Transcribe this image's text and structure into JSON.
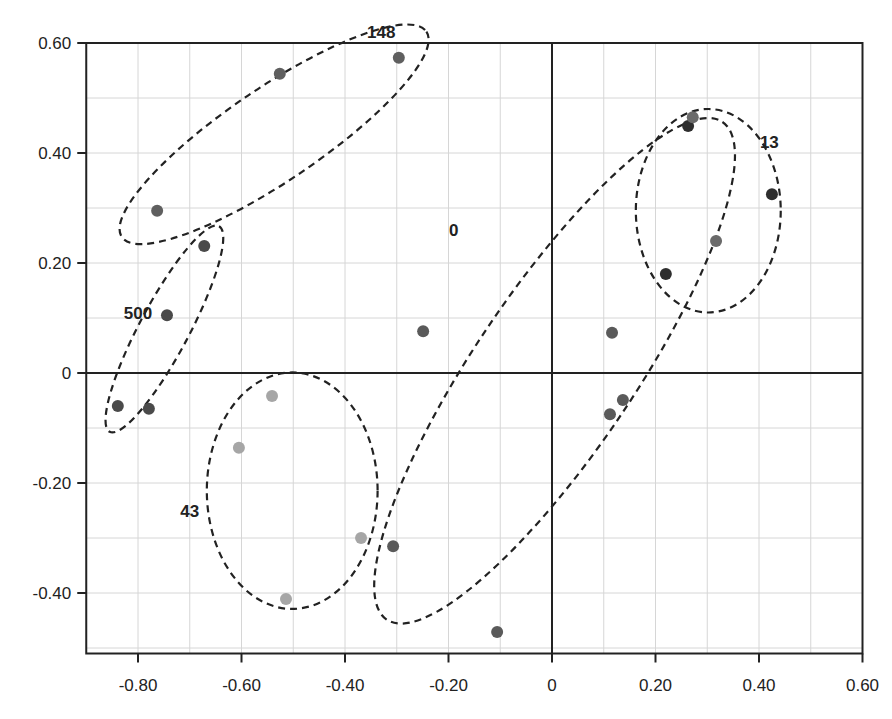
{
  "chart_data": {
    "type": "scatter",
    "title": "",
    "xlabel": "",
    "ylabel": "",
    "xlim": [
      -0.9,
      0.6
    ],
    "ylim": [
      -0.51,
      0.6
    ],
    "grid": true,
    "grid_step": 0.1,
    "x_ticks": [
      -0.8,
      -0.6,
      -0.4,
      -0.2,
      0,
      0.2,
      0.4,
      0.6
    ],
    "x_tick_labels": [
      "-0.80",
      "-0.60",
      "-0.40",
      "-0.20",
      "0",
      "0.20",
      "0.40",
      "0.60"
    ],
    "y_ticks": [
      0.6,
      0.4,
      0.2,
      0,
      -0.2,
      -0.4
    ],
    "y_tick_labels": [
      "0.60",
      "0.40",
      "0.20",
      "0",
      "-0.20",
      "-0.40"
    ],
    "legend": null,
    "clusters": [
      {
        "label": "148",
        "label_pos": [
          -0.33,
          0.62
        ],
        "ellipse": {
          "cx": -0.537,
          "cy": 0.434,
          "rx": 0.355,
          "ry": 0.085,
          "rotation_deg": -34
        }
      },
      {
        "label": "500",
        "label_pos": [
          -0.8,
          0.11
        ],
        "ellipse": {
          "cx": -0.749,
          "cy": 0.08,
          "rx": 0.225,
          "ry": 0.045,
          "rotation_deg": -62
        }
      },
      {
        "label": "43",
        "label_pos": [
          -0.7,
          -0.25
        ],
        "ellipse": {
          "cx": -0.502,
          "cy": -0.214,
          "rx": 0.165,
          "ry": 0.215,
          "rotation_deg": 0
        }
      },
      {
        "label": "0",
        "label_pos": [
          -0.19,
          0.26
        ],
        "ellipse": {
          "cx": 0.005,
          "cy": 0.004,
          "rx": 0.58,
          "ry": 0.145,
          "rotation_deg": -56
        }
      },
      {
        "label": "13",
        "label_pos": [
          0.42,
          0.42
        ],
        "ellipse": {
          "cx": 0.302,
          "cy": 0.295,
          "rx": 0.14,
          "ry": 0.185,
          "rotation_deg": 0
        }
      }
    ],
    "series": [
      {
        "name": "500",
        "color": "#4a4a4a",
        "points": [
          {
            "x": -0.839,
            "y": -0.06
          },
          {
            "x": -0.779,
            "y": -0.065
          },
          {
            "x": -0.744,
            "y": 0.105
          },
          {
            "x": -0.672,
            "y": 0.231
          }
        ]
      },
      {
        "name": "148",
        "color": "#5f5f5f",
        "points": [
          {
            "x": -0.763,
            "y": 0.295
          },
          {
            "x": -0.526,
            "y": 0.544
          },
          {
            "x": -0.296,
            "y": 0.573
          }
        ]
      },
      {
        "name": "43",
        "color": "#a6a6a6",
        "points": [
          {
            "x": -0.541,
            "y": -0.042
          },
          {
            "x": -0.605,
            "y": -0.136
          },
          {
            "x": -0.369,
            "y": -0.3
          },
          {
            "x": -0.514,
            "y": -0.411
          }
        ]
      },
      {
        "name": "0",
        "color": "#5a5a5a",
        "points": [
          {
            "x": -0.307,
            "y": -0.315
          },
          {
            "x": -0.249,
            "y": 0.076
          },
          {
            "x": -0.106,
            "y": -0.471
          },
          {
            "x": 0.116,
            "y": 0.073
          },
          {
            "x": 0.112,
            "y": -0.075
          },
          {
            "x": 0.137,
            "y": -0.049
          }
        ]
      },
      {
        "name": "13",
        "color": "#2e2e2e",
        "points": [
          {
            "x": 0.22,
            "y": 0.18
          },
          {
            "x": 0.317,
            "y": 0.24,
            "color": "#6a6a6a"
          },
          {
            "x": 0.263,
            "y": 0.449
          },
          {
            "x": 0.272,
            "y": 0.465,
            "color": "#6a6a6a"
          },
          {
            "x": 0.425,
            "y": 0.325
          }
        ]
      }
    ]
  },
  "style": {
    "axis_color": "#222222",
    "grid_color": "#d6d6d6",
    "ellipse_color": "#222222"
  }
}
